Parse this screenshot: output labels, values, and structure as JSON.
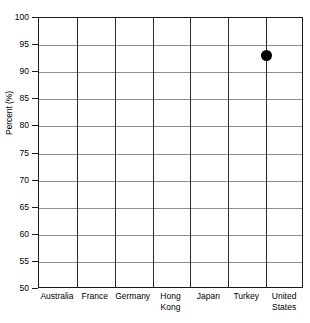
{
  "chart_data": {
    "type": "scatter",
    "title": "",
    "xlabel": "",
    "ylabel": "Percent (%)",
    "categories": [
      "Australia",
      "France",
      "Germany",
      "Hong Kong",
      "Japan",
      "Turkey",
      "United States"
    ],
    "series": [
      {
        "name": "Percent",
        "points": [
          {
            "category": "Australia",
            "value": null
          },
          {
            "category": "France",
            "value": null
          },
          {
            "category": "Germany",
            "value": null
          },
          {
            "category": "Hong Kong",
            "value": null
          },
          {
            "category": "Japan",
            "value": null
          },
          {
            "category": "Turkey",
            "value": 93
          },
          {
            "category": "United States",
            "value": null
          }
        ]
      }
    ],
    "ylim": [
      50,
      100
    ],
    "ytick_labels": [
      "100",
      "95",
      "90",
      "85",
      "80",
      "75",
      "70",
      "65",
      "60",
      "55",
      "50"
    ],
    "ytick_values": [
      100,
      95,
      90,
      85,
      80,
      75,
      70,
      65,
      60,
      55,
      50
    ],
    "grid": true,
    "legend": "none",
    "marker": {
      "shape": "circle",
      "color": "#000000",
      "size_px": 11
    }
  },
  "colors": {
    "axis": "#1b1b1b",
    "hgrid": "#8e8e8e",
    "vgrid": "#2b2b2b",
    "marker": "#000000",
    "background": "#ffffff",
    "text": "#000000"
  }
}
